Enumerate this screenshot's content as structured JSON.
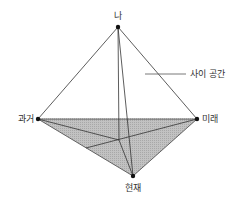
{
  "diagram": {
    "type": "tetrahedron",
    "labels": {
      "top": "나",
      "left": "과거",
      "right": "미래",
      "bottom": "현재",
      "callout": "사이 공간"
    },
    "colors": {
      "line": "#333333",
      "fill": "#bdbdbd",
      "background": "#ffffff"
    }
  }
}
